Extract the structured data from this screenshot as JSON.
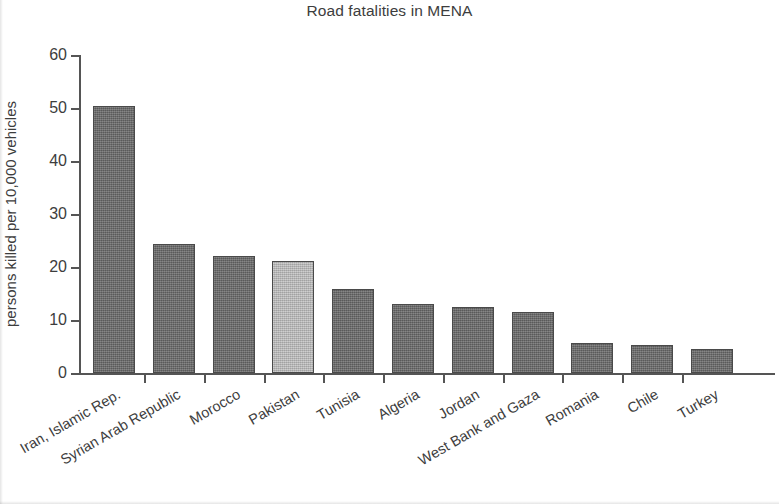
{
  "chart_data": {
    "type": "bar",
    "title": "Road fatalities in MENA",
    "xlabel": "",
    "ylabel": "persons killed per 10,000 vehicles",
    "ylim": [
      0,
      60
    ],
    "ytick_labels": [
      "0",
      "10",
      "20",
      "30",
      "40",
      "50",
      "60"
    ],
    "yticks": [
      0,
      10,
      20,
      30,
      40,
      50,
      60
    ],
    "grid": false,
    "legend": null,
    "categories": [
      "Iran, Islamic Rep.",
      "Syrian Arab Republic",
      "Morocco",
      "Pakistan",
      "Tunisia",
      "Algeria",
      "Jordan",
      "West Bank and Gaza",
      "Romania",
      "Chile",
      "Turkey"
    ],
    "values": [
      50.3,
      24.4,
      22.0,
      21.2,
      15.9,
      13.0,
      12.4,
      11.6,
      5.6,
      5.3,
      4.5
    ],
    "bar_colors": [
      "#6e6e6e",
      "#6e6e6e",
      "#6e6e6e",
      "#bfbfbf",
      "#6e6e6e",
      "#6e6e6e",
      "#6e6e6e",
      "#6e6e6e",
      "#6e6e6e",
      "#6e6e6e",
      "#6e6e6e"
    ],
    "highlight_category": "Pakistan",
    "colors": {
      "bar_dark": "#6e6e6e",
      "bar_light": "#bfbfbf",
      "bar_edge": "#4a4a4a",
      "axis": "#555555",
      "text": "#3d3d3d",
      "background": "#ffffff"
    }
  }
}
